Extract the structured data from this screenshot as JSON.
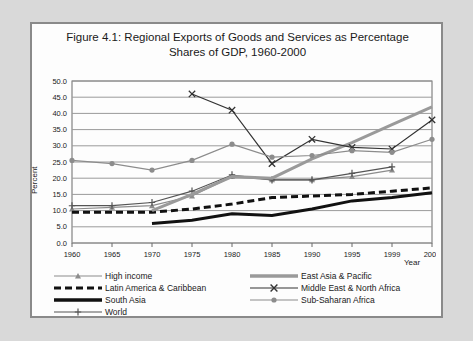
{
  "figure": {
    "title_line1": "Figure 4.1: Regional Exports of Goods and Services as Percentage",
    "title_line2": "Shares of GDP, 1960-2000",
    "ylabel": "Percent",
    "xlabel": "Year"
  },
  "legend": {
    "left": [
      {
        "label": "High income",
        "key": "gray-line-triangle-marker"
      },
      {
        "label": "Latin America & Caribbean",
        "key": "black-thick-dashed-line"
      },
      {
        "label": "South Asia",
        "key": "black-thick-solid-line"
      },
      {
        "label": "World",
        "key": "gray-line-plus-marker"
      }
    ],
    "right": [
      {
        "label": "East Asia & Pacific",
        "key": "gray-thick-solid-line"
      },
      {
        "label": "Middle East & North Africa",
        "key": "dark-line-x-marker"
      },
      {
        "label": "Sub-Saharan Africa",
        "key": "gray-line-circle-marker"
      }
    ]
  },
  "chart_data": {
    "type": "line",
    "title": "Figure 4.1: Regional Exports of Goods and Services as Percentage Shares of GDP, 1960-2000",
    "xlabel": "Year",
    "ylabel": "Percent",
    "ylim": [
      0.0,
      50.0
    ],
    "ytick_step": 5.0,
    "yticks": [
      "0.0",
      "5.0",
      "10.0",
      "15.0",
      "20.0",
      "25.0",
      "30.0",
      "35.0",
      "40.0",
      "45.0",
      "50.0"
    ],
    "categories": [
      "1960",
      "1965",
      "1970",
      "1975",
      "1980",
      "1985",
      "1990",
      "1995",
      "1999",
      "2000"
    ],
    "grid": "horizontal",
    "legend_position": "bottom",
    "series": [
      {
        "name": "High income",
        "color": "#8c8c8c",
        "marker": "triangle",
        "values": [
          10.5,
          11.0,
          11.5,
          14.5,
          20.5,
          19.5,
          19.5,
          20.5,
          22.5,
          null
        ]
      },
      {
        "name": "Latin America & Caribbean",
        "color": "#111111",
        "marker": "none",
        "style": "thick-dashed",
        "values": [
          9.5,
          9.5,
          9.5,
          10.5,
          12.0,
          14.0,
          14.5,
          15.0,
          16.0,
          17.0
        ]
      },
      {
        "name": "South Asia",
        "color": "#111111",
        "marker": "none",
        "style": "thick-solid",
        "values": [
          null,
          null,
          6.0,
          7.0,
          9.0,
          8.5,
          10.5,
          13.0,
          14.0,
          15.5
        ]
      },
      {
        "name": "World",
        "color": "#555555",
        "marker": "plus",
        "values": [
          11.5,
          11.5,
          12.5,
          16.0,
          21.0,
          19.5,
          19.5,
          21.5,
          23.5,
          null
        ]
      },
      {
        "name": "East Asia & Pacific",
        "color": "#9a9a9a",
        "marker": "none",
        "style": "thick-solid",
        "values": [
          null,
          null,
          10.0,
          15.0,
          20.5,
          20.0,
          26.0,
          31.0,
          36.5,
          42.0
        ]
      },
      {
        "name": "Middle East & North Africa",
        "color": "#333333",
        "marker": "x",
        "values": [
          null,
          null,
          null,
          46.0,
          41.0,
          24.5,
          32.0,
          29.5,
          29.0,
          38.0
        ]
      },
      {
        "name": "Sub-Saharan Africa",
        "color": "#8c8c8c",
        "marker": "circle",
        "values": [
          25.5,
          24.5,
          22.5,
          25.5,
          30.5,
          26.5,
          27.0,
          28.5,
          28.0,
          32.0
        ]
      }
    ]
  }
}
